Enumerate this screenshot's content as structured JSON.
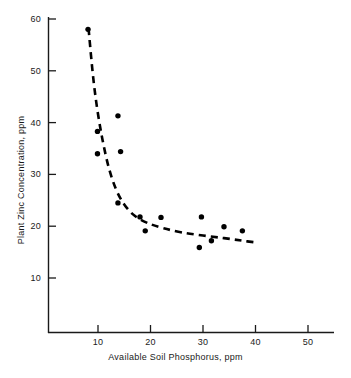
{
  "chart_data": {
    "type": "scatter",
    "title": "",
    "xlabel": "Available Soil Phosphorus, ppm",
    "ylabel": "Plant Zinc Concentration, ppm",
    "xlim": [
      0,
      55
    ],
    "ylim": [
      0,
      63
    ],
    "grid": false,
    "legend": null,
    "xticks": [
      10,
      20,
      30,
      40,
      50
    ],
    "yticks": [
      10,
      20,
      30,
      40,
      50,
      60
    ],
    "xtick_labels": [
      "10",
      "20",
      "30",
      "40",
      "50"
    ],
    "ytick_labels": [
      "10",
      "20",
      "30",
      "40",
      "50",
      "60"
    ],
    "marker": "filled-circle",
    "marker_color": "#000000",
    "series": [
      {
        "name": "Observations",
        "points": [
          {
            "x": 8.1,
            "y": 58.0
          },
          {
            "x": 9.9,
            "y": 38.3
          },
          {
            "x": 9.9,
            "y": 34.0
          },
          {
            "x": 13.8,
            "y": 41.3
          },
          {
            "x": 14.3,
            "y": 34.4
          },
          {
            "x": 13.8,
            "y": 24.5
          },
          {
            "x": 18.0,
            "y": 21.8
          },
          {
            "x": 19.0,
            "y": 19.1
          },
          {
            "x": 22.0,
            "y": 21.7
          },
          {
            "x": 29.3,
            "y": 15.9
          },
          {
            "x": 29.7,
            "y": 21.8
          },
          {
            "x": 31.6,
            "y": 17.2
          },
          {
            "x": 34.0,
            "y": 19.9
          },
          {
            "x": 37.5,
            "y": 19.1
          }
        ]
      }
    ],
    "fitted_curve": {
      "name": "Fitted trend",
      "style": "dashed",
      "color": "#000000",
      "points": [
        {
          "x": 8.2,
          "y": 58.2
        },
        {
          "x": 9.0,
          "y": 49.5
        },
        {
          "x": 9.8,
          "y": 43.0
        },
        {
          "x": 10.8,
          "y": 37.0
        },
        {
          "x": 12.0,
          "y": 31.5
        },
        {
          "x": 13.4,
          "y": 27.2
        },
        {
          "x": 15.0,
          "y": 24.2
        },
        {
          "x": 17.0,
          "y": 22.0
        },
        {
          "x": 19.5,
          "y": 20.6
        },
        {
          "x": 22.5,
          "y": 19.6
        },
        {
          "x": 26.0,
          "y": 18.8
        },
        {
          "x": 30.0,
          "y": 18.2
        },
        {
          "x": 34.0,
          "y": 17.7
        },
        {
          "x": 37.5,
          "y": 17.2
        },
        {
          "x": 40.5,
          "y": 16.8
        }
      ]
    }
  },
  "axes": {
    "x_axis_name": "x-axis",
    "y_axis_name": "y-axis"
  }
}
